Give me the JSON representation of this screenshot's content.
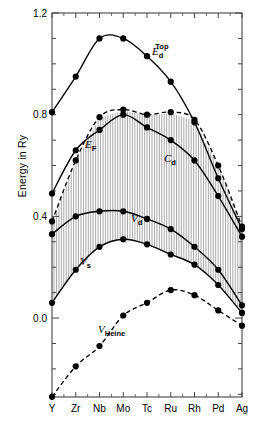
{
  "chart_data": {
    "type": "line",
    "title": "",
    "xlabel": "",
    "ylabel": "Energy in Ry",
    "categories": [
      "Y",
      "Zr",
      "Nb",
      "Mo",
      "Tc",
      "Ru",
      "Rh",
      "Pd",
      "Ag"
    ],
    "ylim": [
      -0.32,
      1.2
    ],
    "yticks": [
      "0.0",
      "0.4",
      "0.8",
      "1.2"
    ],
    "ytick_values": [
      0.0,
      0.4,
      0.8,
      1.2
    ],
    "yminor_step": 0.1,
    "grid": false,
    "legend_position": "inline-annotations",
    "hatch_fill": "vertical lines between V_s and C_d",
    "series": [
      {
        "name": "E_d^Top",
        "label_main": "E",
        "label_sub": "d",
        "label_sup": "Top",
        "style": "solid",
        "marker": "filled-circle",
        "values": [
          0.81,
          0.95,
          1.1,
          1.1,
          1.03,
          0.93,
          0.77,
          0.55,
          0.35
        ]
      },
      {
        "name": "C_d",
        "label_main": "C",
        "label_sub": "d",
        "label_sup": "",
        "style": "dashed",
        "marker": "filled-circle",
        "values": [
          0.38,
          0.62,
          0.79,
          0.82,
          0.8,
          0.81,
          0.78,
          0.6,
          0.36
        ]
      },
      {
        "name": "E_F",
        "label_main": "E",
        "label_sub": "F",
        "label_sup": "",
        "style": "solid",
        "marker": "filled-circle",
        "values": [
          0.49,
          0.66,
          0.74,
          0.8,
          0.75,
          0.7,
          0.62,
          0.48,
          0.32
        ]
      },
      {
        "name": "V_d",
        "label_main": "V",
        "label_sub": "d",
        "label_sup": "",
        "style": "solid",
        "marker": "filled-circle",
        "values": [
          0.33,
          0.4,
          0.42,
          0.42,
          0.39,
          0.35,
          0.28,
          0.19,
          0.05
        ]
      },
      {
        "name": "V_s",
        "label_main": "V",
        "label_sub": "s",
        "label_sup": "",
        "style": "solid",
        "marker": "filled-circle",
        "values": [
          0.06,
          0.19,
          0.28,
          0.31,
          0.29,
          0.25,
          0.21,
          0.13,
          0.02
        ]
      },
      {
        "name": "V_Heine",
        "label_main": "V",
        "label_sub": "Heine",
        "label_sup": "",
        "style": "dashed",
        "marker": "filled-circle",
        "values": [
          -0.31,
          -0.19,
          -0.11,
          0.01,
          0.06,
          0.11,
          0.09,
          0.03,
          -0.03
        ]
      }
    ],
    "annotations": [
      {
        "name": "E_d^Top",
        "x_px": 152,
        "y_px": 55
      },
      {
        "name": "C_d",
        "x_px": 164,
        "y_px": 162
      },
      {
        "name": "E_F",
        "x_px": 85,
        "y_px": 148
      },
      {
        "name": "V_d",
        "x_px": 131,
        "y_px": 222
      },
      {
        "name": "V_s",
        "x_px": 80,
        "y_px": 265
      },
      {
        "name": "V_Heine",
        "x_px": 98,
        "y_px": 333
      }
    ]
  },
  "axis": {
    "y_title": "Energy in Ry",
    "y_tick_labels": [
      "1.2",
      "0.8",
      "0.4",
      "0.0"
    ],
    "x_tick_labels": [
      "Y",
      "Zr",
      "Nb",
      "Mo",
      "Tc",
      "Ru",
      "Rh",
      "Pd",
      "Ag"
    ]
  },
  "colors": {
    "line": "#000000",
    "marker": "#000000",
    "axis": "#444444",
    "hatch": "#8c8c8c",
    "background": "#ffffff"
  }
}
